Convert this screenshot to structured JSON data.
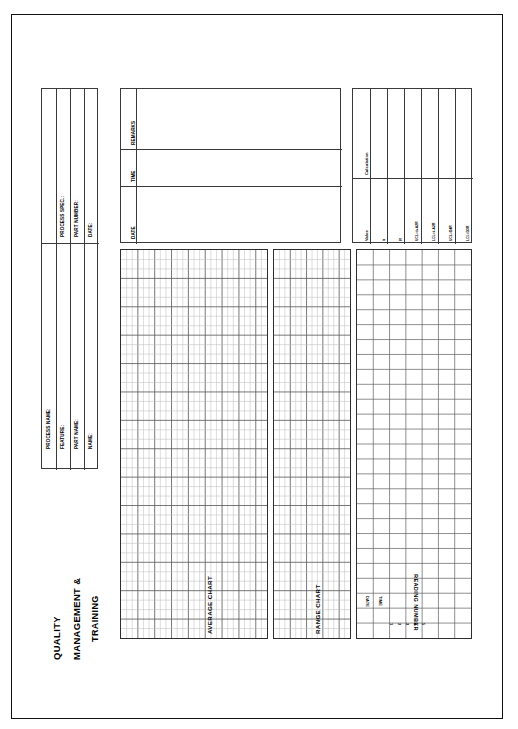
{
  "document": {
    "title_lines": [
      "QUALITY",
      "MANAGEMENT &",
      "TRAINING"
    ],
    "orientation": "landscape-rotated-90"
  },
  "header_block": {
    "left_fields": [
      {
        "label": "PROCESS NAME:",
        "value": ""
      },
      {
        "label": "FEATURE:",
        "value": ""
      },
      {
        "label": "PART NAME:",
        "value": ""
      },
      {
        "label": "NAME:",
        "value": ""
      }
    ],
    "right_fields": [
      {
        "label": "PROCESS SPEC.:",
        "value": ""
      },
      {
        "label": "PART NUMBER:",
        "value": ""
      },
      {
        "label": "DATE:",
        "value": ""
      }
    ]
  },
  "log_block": {
    "rows": [
      {
        "label": "DATE",
        "value": ""
      },
      {
        "label": "TIME",
        "value": ""
      },
      {
        "label": "REMARKS",
        "value": ""
      }
    ]
  },
  "calc_block": {
    "group_label": "Calculation",
    "rows": [
      {
        "label": "Value",
        "value": ""
      },
      {
        "label": "x̄",
        "value": ""
      },
      {
        "label": "R",
        "value": ""
      },
      {
        "label": "UCL=x̄+A2R̄",
        "value": ""
      },
      {
        "label": "LCL=x̄-A2R̄",
        "value": ""
      },
      {
        "label": "UCL=D4R̄",
        "value": ""
      },
      {
        "label": "LCL=D3R̄",
        "value": ""
      }
    ]
  },
  "charts": {
    "average_chart": {
      "label": "AVERAGE CHART",
      "cols": 26,
      "rows": 41,
      "major_every": 3
    },
    "range_chart": {
      "label": "RANGE CHART",
      "cols": 14,
      "rows": 41,
      "major_every": 3
    }
  },
  "data_table": {
    "label": "READING NUMBER",
    "side_columns": [
      "DATE",
      "TIME"
    ],
    "reading_numbers": [
      "1",
      "2",
      "3",
      "4",
      "5"
    ],
    "cols": 7,
    "rows": 26
  },
  "colors": {
    "ink": "#111111",
    "hairline": "#3a3a3a",
    "grid_minor": "#b9b9b9",
    "grid_major": "#5d5d5d",
    "paper": "#ffffff"
  }
}
